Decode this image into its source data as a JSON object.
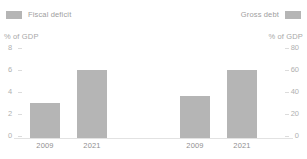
{
  "legend": {
    "left": {
      "label": "Fiscal deficit",
      "swatch_color": "#b5b5b5",
      "swatch_position": "before"
    },
    "right": {
      "label": "Gross debt",
      "swatch_color": "#b5b5b5",
      "swatch_position": "after"
    }
  },
  "axis_captions": {
    "left": "% of GDP",
    "right": "% of GDP"
  },
  "left_axis_ticks": [
    "8",
    "6",
    "4",
    "2",
    "0"
  ],
  "right_axis_ticks": [
    "80",
    "60",
    "40",
    "20",
    "0"
  ],
  "x_labels": {
    "panel1_cat1": "2009",
    "panel1_cat2": "2021",
    "panel2_cat1": "2009",
    "panel2_cat2": "2021"
  },
  "colors": {
    "bar": "#b5b5b5",
    "tick_text": "#b0b0b0",
    "legend_text": "#9e9e9e",
    "caption_text": "#a8a8a8",
    "xlabel_text": "#8f8f8f",
    "baseline": "#e2e2e2",
    "background": "#ffffff"
  },
  "chart_data": {
    "type": "bar",
    "title": "",
    "xlabel": "",
    "ylabel": "% of GDP",
    "grid": false,
    "legend_position": "top",
    "panels": [
      {
        "name": "Fiscal deficit",
        "ylabel": "% of GDP",
        "ylim": [
          0,
          8
        ],
        "yticks": [
          0,
          2,
          4,
          6,
          8
        ],
        "categories": [
          "2009",
          "2021"
        ],
        "values": [
          3.2,
          6.2
        ]
      },
      {
        "name": "Gross debt",
        "ylabel": "% of GDP",
        "ylim": [
          0,
          80
        ],
        "yticks": [
          0,
          20,
          40,
          60,
          80
        ],
        "categories": [
          "2009",
          "2021"
        ],
        "values": [
          38,
          62
        ]
      }
    ]
  }
}
